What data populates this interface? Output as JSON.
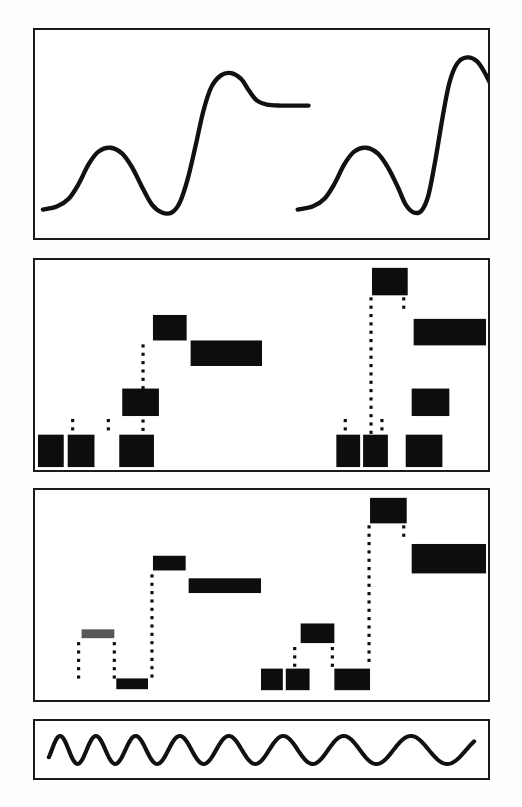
{
  "figure": {
    "background_color": "#fefefe",
    "ink_color": "#0d0d0d",
    "border_color": "#1a1a1a",
    "panel_count": 4
  },
  "panels": [
    {
      "id": "panel-analog-waveform",
      "label": "Analog waveform trace",
      "kind": "continuous-trace",
      "x": 33,
      "y": 28,
      "width": 457,
      "height": 212
    },
    {
      "id": "panel-quantized-a",
      "label": "Quantized block representation A",
      "kind": "block-ladder",
      "x": 33,
      "y": 258,
      "width": 457,
      "height": 214
    },
    {
      "id": "panel-quantized-b",
      "label": "Quantized block representation B",
      "kind": "block-ladder",
      "x": 33,
      "y": 488,
      "width": 457,
      "height": 214
    },
    {
      "id": "panel-chirp",
      "label": "Chirp / clock waveform",
      "kind": "continuous-trace",
      "x": 33,
      "y": 719,
      "width": 457,
      "height": 61
    }
  ],
  "chart_data": [
    {
      "type": "line",
      "id": "analog-waveform",
      "title": "Analog waveform trace",
      "xlabel": "",
      "ylabel": "",
      "xlim": [
        0,
        457
      ],
      "ylim": [
        0,
        212
      ],
      "grid": false,
      "legend": "none",
      "series": [
        {
          "name": "pulse-left",
          "comment": "baseline, bump, dip, fast rise, overshoot, settle",
          "points": [
            [
              8,
              183
            ],
            [
              22,
              180
            ],
            [
              34,
              172
            ],
            [
              44,
              157
            ],
            [
              54,
              137
            ],
            [
              64,
              124
            ],
            [
              76,
              120
            ],
            [
              88,
              126
            ],
            [
              98,
              140
            ],
            [
              108,
              160
            ],
            [
              118,
              178
            ],
            [
              128,
              186
            ],
            [
              138,
              186
            ],
            [
              146,
              176
            ],
            [
              154,
              152
            ],
            [
              162,
              118
            ],
            [
              170,
              82
            ],
            [
              178,
              58
            ],
            [
              188,
              46
            ],
            [
              198,
              44
            ],
            [
              208,
              50
            ],
            [
              216,
              62
            ],
            [
              224,
              72
            ],
            [
              234,
              76
            ],
            [
              248,
              77
            ],
            [
              262,
              77
            ],
            [
              276,
              77
            ]
          ]
        },
        {
          "name": "pulse-right",
          "comment": "second identical pulse, taller overshoot",
          "points": [
            [
              265,
              183
            ],
            [
              280,
              180
            ],
            [
              292,
              172
            ],
            [
              302,
              157
            ],
            [
              312,
              137
            ],
            [
              322,
              124
            ],
            [
              334,
              120
            ],
            [
              346,
              126
            ],
            [
              356,
              140
            ],
            [
              366,
              160
            ],
            [
              374,
              178
            ],
            [
              382,
              186
            ],
            [
              390,
              184
            ],
            [
              397,
              168
            ],
            [
              404,
              132
            ],
            [
              411,
              90
            ],
            [
              418,
              54
            ],
            [
              426,
              34
            ],
            [
              436,
              28
            ],
            [
              446,
              32
            ],
            [
              454,
              44
            ],
            [
              461,
              57
            ],
            [
              470,
              63
            ],
            [
              482,
              64
            ],
            [
              492,
              64
            ],
            [
              500,
              64
            ]
          ]
        }
      ]
    },
    {
      "type": "bar",
      "id": "quantized-blocks-a",
      "title": "Quantized block representation A",
      "xlabel": "",
      "ylabel": "",
      "xlim": [
        0,
        457
      ],
      "ylim": [
        0,
        214
      ],
      "grid": false,
      "legend": "none",
      "comment": "Filled black rectangles at discrete levels, joined by dotted vertical risers",
      "blocks": [
        {
          "x": 3,
          "y": 178,
          "w": 26,
          "h": 33,
          "level": 1,
          "style": "solid"
        },
        {
          "x": 33,
          "y": 178,
          "w": 27,
          "h": 33,
          "level": 1,
          "style": "solid"
        },
        {
          "x": 88,
          "y": 131,
          "w": 37,
          "h": 28,
          "level": 2,
          "style": "solid"
        },
        {
          "x": 85,
          "y": 178,
          "w": 35,
          "h": 33,
          "level": 1,
          "style": "solid"
        },
        {
          "x": 119,
          "y": 56,
          "w": 34,
          "h": 26,
          "level": 4,
          "style": "solid"
        },
        {
          "x": 157,
          "y": 82,
          "w": 72,
          "h": 26,
          "level": 3,
          "style": "solid"
        },
        {
          "x": 304,
          "y": 178,
          "w": 24,
          "h": 33,
          "level": 1,
          "style": "solid"
        },
        {
          "x": 331,
          "y": 178,
          "w": 25,
          "h": 33,
          "level": 1,
          "style": "solid"
        },
        {
          "x": 380,
          "y": 131,
          "w": 38,
          "h": 28,
          "level": 2,
          "style": "solid"
        },
        {
          "x": 374,
          "y": 178,
          "w": 37,
          "h": 33,
          "level": 1,
          "style": "solid"
        },
        {
          "x": 340,
          "y": 8,
          "w": 36,
          "h": 28,
          "level": 5,
          "style": "solid"
        },
        {
          "x": 382,
          "y": 60,
          "w": 73,
          "h": 27,
          "level": 3,
          "style": "solid"
        }
      ],
      "dotted_risers": [
        {
          "x": 38,
          "y0": 162,
          "y1": 176
        },
        {
          "x": 74,
          "y0": 162,
          "y1": 176
        },
        {
          "x": 109,
          "y0": 86,
          "y1": 176
        },
        {
          "x": 313,
          "y0": 162,
          "y1": 176
        },
        {
          "x": 350,
          "y0": 162,
          "y1": 176
        },
        {
          "x": 339,
          "y0": 38,
          "y1": 176
        },
        {
          "x": 372,
          "y0": 38,
          "y1": 50
        }
      ]
    },
    {
      "type": "bar",
      "id": "quantized-blocks-b",
      "title": "Quantized block representation B",
      "xlabel": "",
      "ylabel": "",
      "xlim": [
        0,
        457
      ],
      "ylim": [
        0,
        214
      ],
      "grid": false,
      "legend": "none",
      "comment": "Second pass: thinner flatter blocks, first block degraded/faded, left group dropped to bottom level",
      "blocks": [
        {
          "x": 47,
          "y": 142,
          "w": 33,
          "h": 9,
          "level": 2,
          "style": "faded"
        },
        {
          "x": 82,
          "y": 192,
          "w": 32,
          "h": 11,
          "level": 0,
          "style": "solid"
        },
        {
          "x": 119,
          "y": 67,
          "w": 33,
          "h": 15,
          "level": 4,
          "style": "solid"
        },
        {
          "x": 155,
          "y": 90,
          "w": 73,
          "h": 15,
          "level": 3,
          "style": "solid"
        },
        {
          "x": 228,
          "y": 182,
          "w": 22,
          "h": 22,
          "level": 1,
          "style": "solid"
        },
        {
          "x": 253,
          "y": 182,
          "w": 24,
          "h": 22,
          "level": 1,
          "style": "solid"
        },
        {
          "x": 268,
          "y": 136,
          "w": 34,
          "h": 20,
          "level": 2,
          "style": "solid"
        },
        {
          "x": 302,
          "y": 182,
          "w": 36,
          "h": 22,
          "level": 1,
          "style": "solid"
        },
        {
          "x": 338,
          "y": 8,
          "w": 37,
          "h": 26,
          "level": 5,
          "style": "solid"
        },
        {
          "x": 380,
          "y": 55,
          "w": 75,
          "h": 30,
          "level": 3,
          "style": "solid"
        }
      ],
      "dotted_risers": [
        {
          "x": 44,
          "y0": 155,
          "y1": 192
        },
        {
          "x": 80,
          "y0": 155,
          "y1": 192
        },
        {
          "x": 118,
          "y0": 86,
          "y1": 190
        },
        {
          "x": 262,
          "y0": 160,
          "y1": 182
        },
        {
          "x": 300,
          "y0": 160,
          "y1": 182
        },
        {
          "x": 337,
          "y0": 36,
          "y1": 180
        },
        {
          "x": 372,
          "y0": 36,
          "y1": 48
        }
      ]
    },
    {
      "type": "line",
      "id": "chirp-waveform",
      "title": "Chirp / clock waveform",
      "xlabel": "",
      "ylabel": "",
      "xlim": [
        0,
        457
      ],
      "ylim": [
        0,
        61
      ],
      "grid": false,
      "legend": "none",
      "comment": "Sinusoid whose period lengthens from left to right (down-chirp); ~8 visible cycles",
      "cycles": 8,
      "amplitude": 15,
      "baseline_y": 31,
      "period_start": 33,
      "period_end": 78
    }
  ]
}
